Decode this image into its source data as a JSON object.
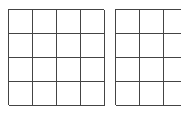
{
  "figure": {
    "title": "",
    "background_color": "#ffffff",
    "line_color": "#444444",
    "line_width_px": 1,
    "width_px": 181,
    "height_px": 114
  },
  "grids": [
    {
      "id": "grid-left",
      "name": "left-grid",
      "rows": 4,
      "cols": 4,
      "x_px": 8,
      "y_px": 9,
      "cell_width_px": 24,
      "cell_height_px": 24,
      "width_px": 96,
      "height_px": 96,
      "clipped_right": false,
      "labels": []
    },
    {
      "id": "grid-right",
      "name": "right-grid",
      "rows": 4,
      "cols": 4,
      "x_px": 115,
      "y_px": 9,
      "cell_width_px": 24,
      "cell_height_px": 24,
      "width_px": 96,
      "height_px": 96,
      "clipped_right": true,
      "labels": []
    }
  ]
}
